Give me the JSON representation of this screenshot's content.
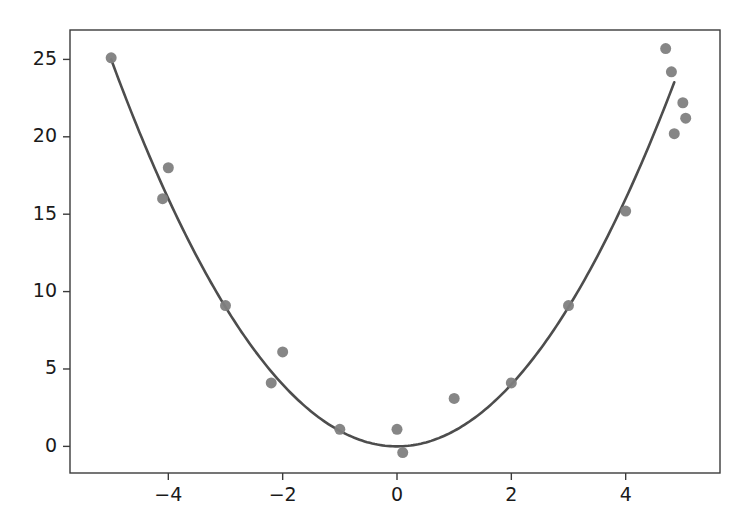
{
  "chart_data": {
    "type": "scatter",
    "title": "",
    "subtitle": "",
    "xlabel": "",
    "ylabel": "",
    "xlim": [
      -5.72,
      5.65
    ],
    "ylim": [
      -1.72,
      26.9
    ],
    "grid": false,
    "legend": "none",
    "xticks": [
      -4,
      -2,
      0,
      2,
      4
    ],
    "xtick_labels": [
      "−4",
      "−2",
      "0",
      "2",
      "4"
    ],
    "yticks": [
      0,
      5,
      10,
      15,
      20,
      25
    ],
    "ytick_labels": [
      "0",
      "5",
      "10",
      "15",
      "20",
      "25"
    ],
    "series": [
      {
        "name": "data points",
        "type": "scatter",
        "marker": "circle",
        "color": "#808080",
        "marker_size": 11,
        "points": [
          {
            "x": -5.0,
            "y": 25.1
          },
          {
            "x": -4.0,
            "y": 18.0
          },
          {
            "x": -4.1,
            "y": 16.0
          },
          {
            "x": -3.0,
            "y": 9.1
          },
          {
            "x": -2.0,
            "y": 6.1
          },
          {
            "x": -2.2,
            "y": 4.1
          },
          {
            "x": -1.0,
            "y": 1.1
          },
          {
            "x": 0.1,
            "y": -0.4
          },
          {
            "x": 0.0,
            "y": 1.1
          },
          {
            "x": 1.0,
            "y": 3.1
          },
          {
            "x": 2.0,
            "y": 4.1
          },
          {
            "x": 3.0,
            "y": 9.1
          },
          {
            "x": 4.0,
            "y": 15.2
          },
          {
            "x": 4.7,
            "y": 25.7
          },
          {
            "x": 4.8,
            "y": 24.2
          },
          {
            "x": 5.0,
            "y": 22.2
          },
          {
            "x": 5.05,
            "y": 21.2
          },
          {
            "x": 4.85,
            "y": 20.2
          }
        ]
      },
      {
        "name": "fitted curve",
        "type": "line",
        "color": "#4d4d4d",
        "line_width": 2.6,
        "equation": "y = x^2",
        "x_start": -5.0,
        "x_end": 4.85,
        "samples": [
          {
            "x": -5.0,
            "y": 25.0
          },
          {
            "x": -4.5,
            "y": 20.25
          },
          {
            "x": -4.0,
            "y": 16.0
          },
          {
            "x": -3.5,
            "y": 12.25
          },
          {
            "x": -3.0,
            "y": 9.0
          },
          {
            "x": -2.5,
            "y": 6.25
          },
          {
            "x": -2.0,
            "y": 4.0
          },
          {
            "x": -1.5,
            "y": 2.25
          },
          {
            "x": -1.0,
            "y": 1.0
          },
          {
            "x": -0.5,
            "y": 0.25
          },
          {
            "x": 0.0,
            "y": 0.0
          },
          {
            "x": 0.5,
            "y": 0.25
          },
          {
            "x": 1.0,
            "y": 1.0
          },
          {
            "x": 1.5,
            "y": 2.25
          },
          {
            "x": 2.0,
            "y": 4.0
          },
          {
            "x": 2.5,
            "y": 6.25
          },
          {
            "x": 3.0,
            "y": 9.0
          },
          {
            "x": 3.5,
            "y": 12.25
          },
          {
            "x": 4.0,
            "y": 16.0
          },
          {
            "x": 4.5,
            "y": 20.25
          },
          {
            "x": 4.85,
            "y": 23.52
          }
        ]
      }
    ]
  },
  "figure": {
    "background_color": "#ffffff",
    "axes_color": "#3b3b3b",
    "point_color": "#808080",
    "curve_color": "#4d4d4d"
  }
}
